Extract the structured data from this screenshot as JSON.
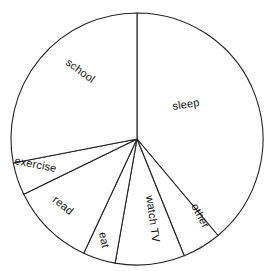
{
  "chart_data": {
    "type": "pie",
    "title": "",
    "xlabel": "",
    "ylabel": "",
    "legend_position": "none",
    "grid": false,
    "labels_inside_slices": true,
    "start_angle_deg": 0,
    "direction": "clockwise",
    "center": {
      "x": 137,
      "y": 139
    },
    "radius": 126,
    "total": 24,
    "unit": "hours",
    "categories": [
      "sleep",
      "other",
      "watch TV",
      "eat",
      "read",
      "exercise",
      "school"
    ],
    "values": [
      9.3,
      1.2,
      2.1,
      1.0,
      2.6,
      1.0,
      6.8
    ],
    "slices": [
      {
        "label": "sleep",
        "value": 9.3,
        "percent": 38.9,
        "start_angle": 0,
        "end_angle": 140,
        "label_x": 173,
        "label_y": 110,
        "label_rotation": -9
      },
      {
        "label": "other",
        "value": 1.2,
        "percent": 5.0,
        "start_angle": 140,
        "end_angle": 158,
        "label_x": 191,
        "label_y": 206,
        "label_rotation": 62
      },
      {
        "label": "watch TV",
        "value": 2.1,
        "percent": 8.8,
        "start_angle": 158,
        "end_angle": 190,
        "label_x": 146,
        "label_y": 196,
        "label_rotation": 82
      },
      {
        "label": "eat",
        "value": 1.0,
        "percent": 4.2,
        "start_angle": 190,
        "end_angle": 205,
        "label_x": 99,
        "label_y": 233,
        "label_rotation": 78
      },
      {
        "label": "read",
        "value": 2.6,
        "percent": 10.8,
        "start_angle": 205,
        "end_angle": 244,
        "label_x": 52,
        "label_y": 201,
        "label_rotation": 39
      },
      {
        "label": "exercise",
        "value": 1.0,
        "percent": 4.2,
        "start_angle": 244,
        "end_angle": 259,
        "label_x": 14,
        "label_y": 164,
        "label_rotation": 11
      },
      {
        "label": "school",
        "value": 6.8,
        "percent": 28.3,
        "start_angle": 259,
        "end_angle": 360,
        "label_x": 65,
        "label_y": 64,
        "label_rotation": 36
      }
    ],
    "colors": {
      "slice_fill": "#ffffff",
      "slice_stroke": "#242424",
      "label_text": "#111111",
      "background": "#ffffff"
    }
  }
}
